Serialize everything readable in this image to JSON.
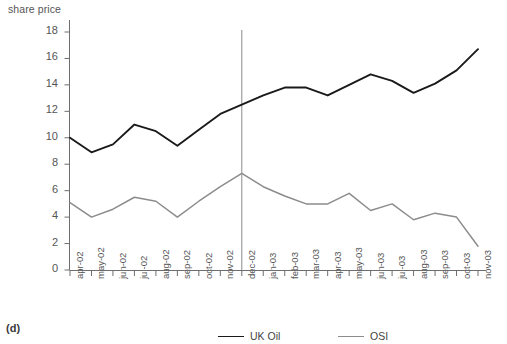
{
  "panel": {
    "label": "(d)"
  },
  "chart_data": {
    "type": "line",
    "title": "",
    "ylabel": "share price",
    "xlabel": "",
    "ylim": [
      0,
      18
    ],
    "yticks": [
      0,
      2,
      4,
      6,
      8,
      10,
      12,
      14,
      16,
      18
    ],
    "grid": false,
    "legend_position": "bottom",
    "categories": [
      "apr-02",
      "may-02",
      "jun-02",
      "jul-02",
      "aug-02",
      "sep-02",
      "oct-02",
      "nov-02",
      "dec-02",
      "jan-03",
      "feb-03",
      "mar-03",
      "apr-03",
      "may-03",
      "jun-03",
      "jul-03",
      "aug-03",
      "sep-03",
      "oct-03",
      "nov-03"
    ],
    "series": [
      {
        "name": "UK Oil",
        "color": "#1a1a1a",
        "values": [
          10.0,
          8.9,
          9.5,
          11.0,
          10.5,
          9.4,
          10.6,
          11.8,
          12.5,
          13.2,
          13.8,
          13.8,
          13.2,
          14.0,
          14.8,
          14.3,
          13.4,
          14.1,
          15.1,
          16.7
        ]
      },
      {
        "name": "OSI",
        "color": "#8c8c8c",
        "values": [
          5.1,
          4.0,
          4.6,
          5.5,
          5.2,
          4.0,
          5.2,
          6.3,
          7.3,
          6.3,
          5.6,
          5.0,
          5.0,
          5.8,
          4.5,
          5.0,
          3.8,
          4.3,
          4.0,
          1.8
        ]
      }
    ],
    "annotations": [
      {
        "type": "vline",
        "at": "dec-02",
        "color": "#8c8c8c"
      }
    ]
  },
  "legend": {
    "entries": [
      {
        "label": "UK Oil",
        "color": "#1a1a1a"
      },
      {
        "label": "OSI",
        "color": "#8c8c8c"
      }
    ]
  }
}
